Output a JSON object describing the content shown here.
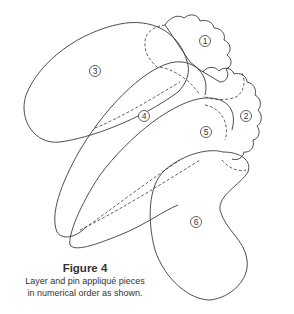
{
  "figure": {
    "title": "Figure 4",
    "caption_lines": [
      "Layer and pin appliqué pieces",
      "in numerical order as shown."
    ]
  },
  "pieces": [
    {
      "number": "1",
      "shape": "scalloped-flower"
    },
    {
      "number": "2",
      "shape": "scalloped-flower"
    },
    {
      "number": "3",
      "shape": "leaf"
    },
    {
      "number": "4",
      "shape": "leaf"
    },
    {
      "number": "5",
      "shape": "leaf"
    },
    {
      "number": "6",
      "shape": "kidney"
    }
  ],
  "colors": {
    "line": "#3a3a3a",
    "background": "#ffffff"
  }
}
